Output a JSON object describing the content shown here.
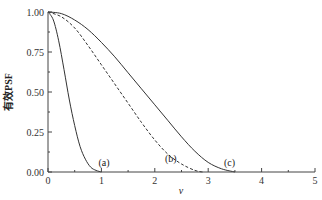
{
  "chart_data": {
    "type": "line",
    "title": "",
    "xlabel": "v",
    "ylabel": "有效PSF",
    "xlim": [
      0,
      5
    ],
    "ylim": [
      0,
      1
    ],
    "x_ticks": [
      "0",
      "1",
      "2",
      "3",
      "4",
      "5"
    ],
    "y_ticks": [
      "0.00",
      "0.25",
      "0.50",
      "0.75",
      "1.00"
    ],
    "grid": false,
    "legend": "none (curves labeled inline)",
    "series": [
      {
        "name": "(a)",
        "style": "solid",
        "label_pos": [
          1.05,
          0.04
        ],
        "x": [
          0,
          0.1,
          0.2,
          0.3,
          0.4,
          0.5,
          0.6,
          0.7,
          0.8,
          0.9,
          1.0
        ],
        "y": [
          1.0,
          0.95,
          0.82,
          0.64,
          0.45,
          0.29,
          0.16,
          0.08,
          0.03,
          0.01,
          0.0
        ]
      },
      {
        "name": "(b)",
        "style": "dashed",
        "label_pos": [
          2.3,
          0.06
        ],
        "x": [
          0,
          0.25,
          0.5,
          0.75,
          1.0,
          1.25,
          1.5,
          1.75,
          2.0,
          2.25,
          2.5,
          2.75,
          2.9
        ],
        "y": [
          1.0,
          0.97,
          0.9,
          0.79,
          0.67,
          0.55,
          0.43,
          0.31,
          0.2,
          0.11,
          0.05,
          0.01,
          0.0
        ]
      },
      {
        "name": "(c)",
        "style": "solid",
        "label_pos": [
          3.4,
          0.04
        ],
        "x": [
          0,
          0.25,
          0.5,
          0.75,
          1.0,
          1.25,
          1.5,
          1.75,
          2.0,
          2.25,
          2.5,
          2.75,
          3.0,
          3.25,
          3.5
        ],
        "y": [
          1.0,
          0.99,
          0.95,
          0.89,
          0.81,
          0.72,
          0.62,
          0.52,
          0.42,
          0.32,
          0.22,
          0.13,
          0.06,
          0.02,
          0.0
        ]
      }
    ]
  }
}
